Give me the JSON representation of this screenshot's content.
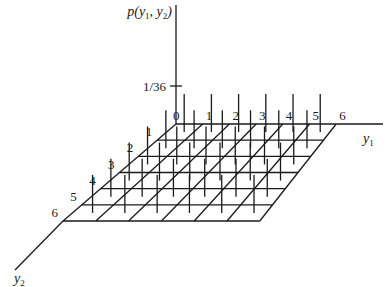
{
  "figure": {
    "type": "3d-bar-grid",
    "z_axis_label": "p(y1, y2)",
    "z_axis_label_parts": {
      "prefix": "p(",
      "v1": "y",
      "s1": "1",
      "sep": ", ",
      "v2": "y",
      "s2": "2",
      "suffix": ")"
    },
    "x_axis_label": {
      "var": "y",
      "sub": "1"
    },
    "y_axis_label": {
      "var": "y",
      "sub": "2"
    },
    "z_tick_label": "1/36",
    "y1_ticks": [
      "0",
      "1",
      "2",
      "3",
      "4",
      "5",
      "6"
    ],
    "y2_ticks": [
      "1",
      "2",
      "3",
      "4",
      "5",
      "6"
    ]
  },
  "chart_data": {
    "type": "3d-bar",
    "title": "",
    "xlabel": "y1",
    "ylabel": "y2",
    "zlabel": "p(y1, y2)",
    "x": [
      1,
      2,
      3,
      4,
      5,
      6
    ],
    "y": [
      1,
      2,
      3,
      4,
      5,
      6
    ],
    "value_each": "1/36",
    "z_ticks": [
      "1/36"
    ],
    "grid_tick_labels_y1": [
      "0",
      "1",
      "2",
      "3",
      "4",
      "5",
      "6"
    ],
    "grid_tick_labels_y2": [
      "1",
      "2",
      "3",
      "4",
      "5",
      "6"
    ]
  },
  "geometry": {
    "origin": [
      176,
      124
    ],
    "back_spacing": 26.7,
    "front_left": [
      63,
      221
    ],
    "front_spacing": 32.8,
    "rows": 6,
    "cols": 6,
    "bar_height": 38,
    "z_axis_top": 5,
    "z_tick_y": 86,
    "y1_axis_end": 383,
    "y2_axis_end": [
      15,
      270
    ]
  }
}
